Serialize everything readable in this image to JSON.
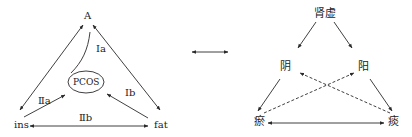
{
  "left_diagram": {
    "nodes": {
      "top": "A",
      "center": "PCOS",
      "bottom_left": "ins",
      "bottom_right": "fat"
    },
    "edge_labels": {
      "top_to_center": "Ⅰa",
      "right_to_center": "Ⅰb",
      "left_to_center": "Ⅱa",
      "bottom": "Ⅱb"
    }
  },
  "connector": "double-arrow",
  "right_diagram": {
    "nodes": {
      "top": "肾虚",
      "mid_left": "阴",
      "mid_right": "阳",
      "bottom_left": "瘀",
      "bottom_right": "痰"
    }
  },
  "colors": {
    "line": "#2a2a2a",
    "background": "#ffffff"
  }
}
